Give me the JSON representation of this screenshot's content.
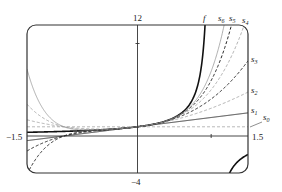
{
  "chart_data": {
    "type": "line",
    "title": "",
    "xlabel": "",
    "ylabel": "",
    "xlim": [
      -1.5,
      1.5
    ],
    "ylim": [
      -4,
      12
    ],
    "grid": false,
    "legend": "inline labels at right edge",
    "tick_labels": {
      "x_min": "−1.5",
      "x_max": "1.5",
      "y_max": "12",
      "y_min": "−4"
    },
    "series": [
      {
        "name": "f",
        "formula": "1/(1-x)",
        "style": "solid",
        "color": "#111111",
        "width": 1.6
      },
      {
        "name": "s0",
        "formula": "sum_{k=0}^{0} x^k",
        "degree": 0,
        "style": "dashed",
        "color": "#9a9a9a",
        "width": 0.8
      },
      {
        "name": "s1",
        "formula": "sum_{k=0}^{1} x^k",
        "degree": 1,
        "style": "solid",
        "color": "#222222",
        "width": 0.9
      },
      {
        "name": "s2",
        "formula": "sum_{k=0}^{2} x^k",
        "degree": 2,
        "style": "dashed",
        "color": "#9a9a9a",
        "width": 0.8
      },
      {
        "name": "s3",
        "formula": "sum_{k=0}^{3} x^k",
        "degree": 3,
        "style": "dashed",
        "color": "#222222",
        "width": 1.0
      },
      {
        "name": "s4",
        "formula": "sum_{k=0}^{4} x^k",
        "degree": 4,
        "style": "dashed",
        "color": "#9a9a9a",
        "width": 0.8
      },
      {
        "name": "s5",
        "formula": "sum_{k=0}^{5} x^k",
        "degree": 5,
        "style": "dashed",
        "color": "#222222",
        "width": 1.0
      },
      {
        "name": "s6",
        "formula": "sum_{k=0}^{6} x^k",
        "degree": 6,
        "style": "solid",
        "color": "#9a9a9a",
        "width": 0.8
      }
    ],
    "sample_values": {
      "x": [
        -1.5,
        -1.0,
        -0.5,
        0,
        0.5,
        1.0,
        1.5
      ],
      "f": [
        0.4,
        0.5,
        0.667,
        1,
        2,
        null,
        -2
      ],
      "s0": [
        1,
        1,
        1,
        1,
        1,
        1,
        1
      ],
      "s1": [
        -0.5,
        0,
        0.5,
        1,
        1.5,
        2,
        2.5
      ],
      "s2": [
        1.75,
        1,
        0.75,
        1,
        1.75,
        3,
        4.75
      ],
      "s3": [
        -1.625,
        0,
        0.625,
        1,
        1.875,
        4,
        8.125
      ],
      "s4": [
        3.4375,
        1,
        0.6875,
        1,
        1.9375,
        5,
        13.19
      ],
      "s5": [
        -4.156,
        0,
        0.656,
        1,
        1.969,
        6,
        20.78
      ],
      "s6": [
        7.234,
        1,
        0.672,
        1,
        1.984,
        7,
        32.17
      ]
    },
    "labels": {
      "f": "f",
      "s0": "s",
      "s1": "s",
      "s2": "s",
      "s3": "s",
      "s4": "s",
      "s5": "s",
      "s6": "s"
    },
    "label_subscripts": {
      "s0": "0",
      "s1": "1",
      "s2": "2",
      "s3": "3",
      "s4": "4",
      "s5": "5",
      "s6": "6"
    }
  },
  "axes": {
    "y_top_label": "12",
    "y_bottom_label": "−4",
    "x_left_label": "−1.5",
    "x_right_label": "1.5"
  }
}
